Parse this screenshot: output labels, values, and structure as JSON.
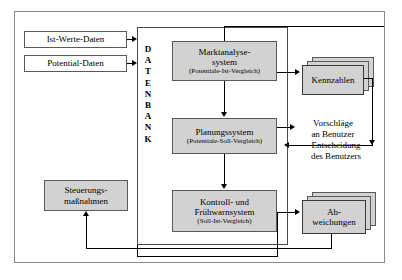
{
  "diagram": {
    "database_label": "DATENBANK",
    "database_letters": [
      "D",
      "A",
      "T",
      "E",
      "N",
      "B",
      "A",
      "N",
      "K"
    ],
    "inputs": [
      {
        "label": "Ist-Werte-Daten"
      },
      {
        "label": "Potential-Daten"
      }
    ],
    "systems": [
      {
        "title": "Marktanalyse-",
        "title2": "system",
        "subtitle": "(Potentiale-Ist-Vergleich)"
      },
      {
        "title": "Planungssystem",
        "title2": "",
        "subtitle": "(Potentiale-Soll-Vergleich)"
      },
      {
        "title": "Kontroll- und",
        "title2": "Frühwarnsystem",
        "subtitle": "(Soll-Ist-Vergleich)"
      }
    ],
    "outputs": [
      {
        "line1": "Kennzahlen",
        "line2": ""
      },
      {
        "line1": "Ab-",
        "line2": "weichungen"
      }
    ],
    "annotations": [
      {
        "line1": "Vorschläge",
        "line2": "an Benutzer"
      },
      {
        "line1": "Entscheidung",
        "line2": "des Benutzers"
      }
    ],
    "measures": {
      "line1": "Steuerungs-",
      "line2": "maßnahmen"
    },
    "colors": {
      "box_fill": "#d2d2d2",
      "box_border": "#5a5a5a",
      "frame_border": "#8a8a8a",
      "connector": "#000000",
      "page_background": "#ffffff"
    }
  }
}
